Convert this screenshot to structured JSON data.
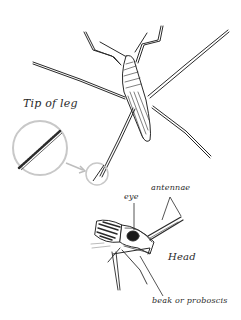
{
  "figure": {
    "labels": {
      "tip_of_leg": "Tip of leg",
      "eye": "eye",
      "antennae": "antennae",
      "head": "Head",
      "beak": "beak or proboscis"
    },
    "colors": {
      "ink": "#2a2a2a",
      "magnifier_circle": "#c8c8c8",
      "background": "#ffffff"
    }
  }
}
